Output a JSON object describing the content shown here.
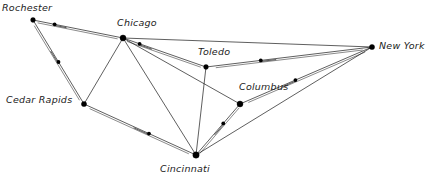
{
  "diagram": {
    "background_color": "#ffffff",
    "edge_color": "#1a1a1a",
    "node_color": "#000000",
    "label_color": "#1b1b1b",
    "width": 430,
    "height": 181
  },
  "nodes": [
    {
      "id": "rochester",
      "label": "Rochester",
      "x": 33,
      "y": 20,
      "label_x": 2,
      "label_y": 3,
      "dot_r": 2.4
    },
    {
      "id": "chicago",
      "label": "Chicago",
      "x": 123,
      "y": 38,
      "label_x": 117,
      "label_y": 18,
      "dot_r": 3.0
    },
    {
      "id": "toledo",
      "label": "Toledo",
      "x": 206,
      "y": 67,
      "label_x": 198,
      "label_y": 47,
      "dot_r": 2.4
    },
    {
      "id": "new-york",
      "label": "New York",
      "x": 372,
      "y": 47,
      "label_x": 379,
      "label_y": 41,
      "dot_r": 2.6
    },
    {
      "id": "cedar-rapids",
      "label": "Cedar Rapids",
      "x": 84,
      "y": 104,
      "label_x": 6,
      "label_y": 95,
      "dot_r": 2.6
    },
    {
      "id": "columbus",
      "label": "Columbus",
      "x": 240,
      "y": 104,
      "label_x": 239,
      "label_y": 82,
      "dot_r": 3.0
    },
    {
      "id": "cincinnati",
      "label": "Cincinnati",
      "x": 196,
      "y": 155,
      "label_x": 160,
      "label_y": 164,
      "dot_r": 3.2
    }
  ],
  "edges": [
    {
      "id": "rochester-chicago",
      "from": "rochester",
      "to": "chicago",
      "doubled": true,
      "marker": {
        "t": 0.24,
        "dir": "backward",
        "tail": 12
      }
    },
    {
      "id": "rochester-cedar",
      "from": "rochester",
      "to": "cedar-rapids",
      "doubled": true,
      "marker": {
        "t": 0.5,
        "dir": "forward",
        "tail": 13
      }
    },
    {
      "id": "chicago-toledo",
      "from": "chicago",
      "to": "toledo",
      "doubled": true,
      "marker": {
        "t": 0.2,
        "dir": "backward",
        "tail": 13
      }
    },
    {
      "id": "chicago-new-york",
      "from": "chicago",
      "to": "new-york",
      "doubled": false,
      "marker": null
    },
    {
      "id": "chicago-cedar-rapids",
      "from": "chicago",
      "to": "cedar-rapids",
      "doubled": false,
      "marker": null
    },
    {
      "id": "chicago-cincinnati",
      "from": "chicago",
      "to": "cincinnati",
      "doubled": false,
      "marker": null
    },
    {
      "id": "chicago-columbus",
      "from": "chicago",
      "to": "columbus",
      "doubled": false,
      "marker": null
    },
    {
      "id": "toledo-new-york",
      "from": "toledo",
      "to": "new-york",
      "doubled": true,
      "marker": {
        "t": 0.33,
        "dir": "backward",
        "tail": 15
      }
    },
    {
      "id": "toledo-cincinnati",
      "from": "toledo",
      "to": "cincinnati",
      "doubled": false,
      "marker": null
    },
    {
      "id": "cedar-cincinnati",
      "from": "cedar-rapids",
      "to": "cincinnati",
      "doubled": true,
      "marker": {
        "t": 0.58,
        "dir": "forward",
        "tail": 16
      }
    },
    {
      "id": "columbus-new-york",
      "from": "columbus",
      "to": "new-york",
      "doubled": true,
      "marker": {
        "t": 0.42,
        "dir": "forward",
        "tail": 15
      }
    },
    {
      "id": "cincinnati-columbus",
      "from": "cincinnati",
      "to": "columbus",
      "doubled": true,
      "marker": {
        "t": 0.62,
        "dir": "forward",
        "tail": 14
      }
    },
    {
      "id": "cincinnati-new-york",
      "from": "cincinnati",
      "to": "new-york",
      "doubled": false,
      "marker": null
    }
  ]
}
